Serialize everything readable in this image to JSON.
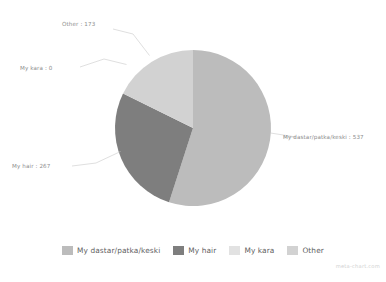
{
  "chart_data": {
    "type": "pie",
    "title": "",
    "xlabel": "",
    "ylabel": "",
    "grid": false,
    "legend_position": "bottom",
    "start_angle_deg": 0,
    "direction": "clockwise",
    "total": 977,
    "categories": [
      "My dastar/patka/keski",
      "My hair",
      "My kara",
      "Other"
    ],
    "values": [
      537,
      267,
      0,
      173
    ],
    "colors": [
      "#bcbcbc",
      "#7e7e7e",
      "#e2e2e2",
      "#d2d2d2"
    ],
    "slices": [
      {
        "label": "My dastar/patka/keski",
        "value": 537,
        "color": "#bcbcbc",
        "annotation": "My dastar/patka/keski : 537",
        "percent": 54.96,
        "start_deg": 0,
        "sweep_deg": 197.87
      },
      {
        "label": "My hair",
        "value": 267,
        "color": "#7e7e7e",
        "annotation": "My hair : 267",
        "percent": 27.33,
        "start_deg": 197.87,
        "sweep_deg": 98.38
      },
      {
        "label": "My kara",
        "value": 0,
        "color": "#e2e2e2",
        "annotation": "My kara : 0",
        "percent": 0.0,
        "start_deg": 296.25,
        "sweep_deg": 0
      },
      {
        "label": "Other",
        "value": 173,
        "color": "#d2d2d2",
        "annotation": "Other : 173",
        "percent": 17.71,
        "start_deg": 296.25,
        "sweep_deg": 63.75
      }
    ]
  },
  "annotations": {
    "other": "Other : 173",
    "my_kara": "My kara : 0",
    "my_hair": "My hair : 267",
    "my_dastar": "My dastar/patka/keski : 537"
  },
  "legend": {
    "items": [
      {
        "label": "My dastar/patka/keski",
        "color": "#bcbcbc"
      },
      {
        "label": "My hair",
        "color": "#7e7e7e"
      },
      {
        "label": "My kara",
        "color": "#e2e2e2"
      },
      {
        "label": "Other",
        "color": "#d2d2d2"
      }
    ]
  },
  "watermark": "meta-chart.com"
}
